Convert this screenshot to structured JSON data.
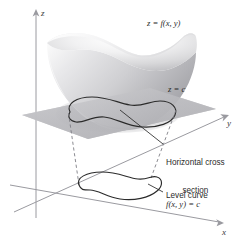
{
  "figure": {
    "background_color": "#ffffff",
    "ink_color": "#2b2b2b",
    "axis_color": "#9a9aa0",
    "plane_color": "#b9b9bc",
    "surface_light": "#f2f2f3",
    "surface_mid": "#d4d4d6",
    "surface_dark": "#a9a9ad"
  },
  "axes": {
    "z_label": "z",
    "y_label": "y",
    "x_label": "x",
    "origin": {
      "x": 36,
      "y": 200
    }
  },
  "labels": {
    "surface_equation": "z = f(x, y)",
    "plane_equation": "z = c",
    "cross_section_line1": "Horizontal cross",
    "cross_section_line2": "section",
    "level_curve_title": "Level curve",
    "level_curve_equation": "f(x, y) = c"
  },
  "elements": {
    "surface_name": "bowl-surface",
    "plane_name": "horizontal-plane",
    "cross_section_name": "cross-section-curve",
    "level_curve_name": "level-curve",
    "projection_lines": 2
  }
}
